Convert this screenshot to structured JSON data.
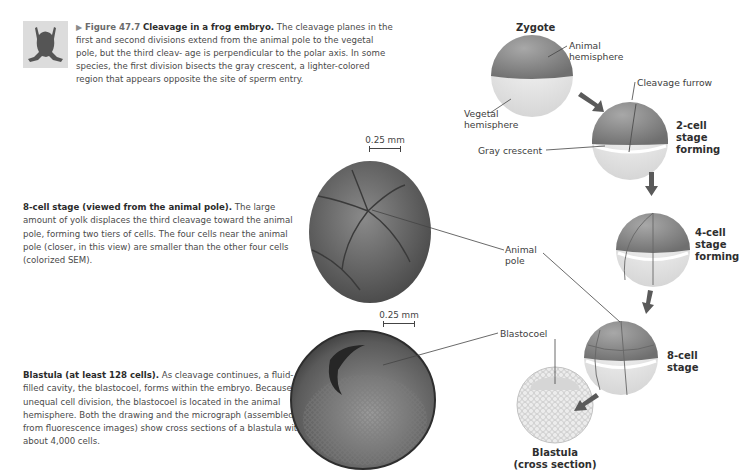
{
  "figure": {
    "thumbnail": "frog-silhouette-icon",
    "marker": "▶",
    "number": "Figure 47.7",
    "title": "Cleavage in a frog embryo.",
    "caption_lines": [
      "The cleavage planes in the first and",
      "second divisions extend from the animal pole to the vegetal pole, but the third cleav-",
      "age is perpendicular to the polar axis. In some species, the first division bisects the",
      "gray crescent, a lighter-colored region that appears opposite the site of sperm entry."
    ]
  },
  "eight_cell_panel": {
    "heading": "8-cell stage (viewed from the animal pole).",
    "body": "The large amount of yolk displaces the third cleavage toward the animal pole, forming two tiers of cells. The four cells near the animal pole (closer, in this view) are smaller than the other four cells (colorized SEM).",
    "scale": "0.25 mm"
  },
  "blastula_panel": {
    "heading": "Blastula (at least 128 cells).",
    "body": "As cleavage continues, a fluid-filled cavity, the blastocoel, forms within the embryo. Because of unequal cell division, the blastocoel is located in the animal hemisphere. Both the drawing and the micrograph (assembled from fluorescence images) show cross sections of a blastula with about 4,000 cells.",
    "scale": "0.25 mm"
  },
  "labels": {
    "zygote": "Zygote",
    "animal_hemisphere": [
      "Animal",
      "hemisphere"
    ],
    "vegetal_hemisphere": [
      "Vegetal",
      "hemisphere"
    ],
    "cleavage_furrow": "Cleavage furrow",
    "gray_crescent": "Gray crescent",
    "animal_pole": [
      "Animal",
      "pole"
    ],
    "blastocoel": "Blastocoel"
  },
  "stages": {
    "two_cell": [
      "2-cell",
      "stage",
      "forming"
    ],
    "four_cell": [
      "4-cell",
      "stage",
      "forming"
    ],
    "eight_cell": [
      "8-cell",
      "stage"
    ],
    "blastula": [
      "Blastula",
      "(cross section)"
    ]
  },
  "colors": {
    "animal_hemisphere": "#8a8a8a",
    "vegetal_hemisphere": "#e6e6e6",
    "arrow": "#5a5a5a",
    "sem_embryo": "#6e6e6e",
    "micrograph": "#5a5a5a"
  }
}
